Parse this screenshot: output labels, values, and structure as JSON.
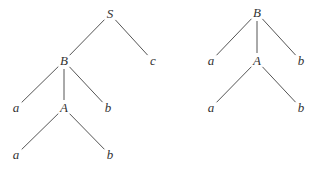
{
  "trees": [
    {
      "name": "left-tree",
      "nodes": [
        {
          "id": "S",
          "label": "S",
          "x": 110,
          "y": 14
        },
        {
          "id": "B",
          "label": "B",
          "x": 64,
          "y": 61
        },
        {
          "id": "c",
          "label": "c",
          "x": 153,
          "y": 61
        },
        {
          "id": "a1",
          "label": "a",
          "x": 16,
          "y": 108
        },
        {
          "id": "A",
          "label": "A",
          "x": 64,
          "y": 108
        },
        {
          "id": "b1",
          "label": "b",
          "x": 108,
          "y": 108
        },
        {
          "id": "a2",
          "label": "a",
          "x": 16,
          "y": 155
        },
        {
          "id": "b2",
          "label": "b",
          "x": 110,
          "y": 155
        }
      ],
      "edges": [
        [
          "S",
          "B"
        ],
        [
          "S",
          "c"
        ],
        [
          "B",
          "a1"
        ],
        [
          "B",
          "A"
        ],
        [
          "B",
          "b1"
        ],
        [
          "A",
          "a2"
        ],
        [
          "A",
          "b2"
        ]
      ]
    },
    {
      "name": "right-tree",
      "nodes": [
        {
          "id": "B",
          "label": "B",
          "x": 257,
          "y": 13
        },
        {
          "id": "a1",
          "label": "a",
          "x": 211,
          "y": 61
        },
        {
          "id": "A",
          "label": "A",
          "x": 257,
          "y": 61
        },
        {
          "id": "b1",
          "label": "b",
          "x": 301,
          "y": 61
        },
        {
          "id": "a2",
          "label": "a",
          "x": 211,
          "y": 108
        },
        {
          "id": "b2",
          "label": "b",
          "x": 301,
          "y": 108
        }
      ],
      "edges": [
        [
          "B",
          "a1"
        ],
        [
          "B",
          "A"
        ],
        [
          "B",
          "b1"
        ],
        [
          "A",
          "a2"
        ],
        [
          "A",
          "b2"
        ]
      ]
    }
  ]
}
